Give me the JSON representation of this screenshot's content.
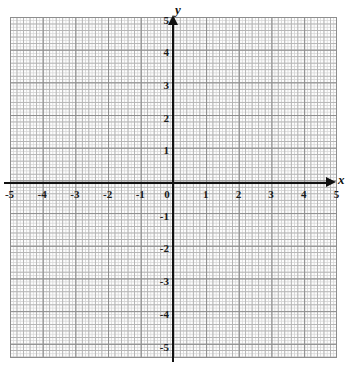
{
  "chart_data": {
    "type": "scatter",
    "title": "",
    "subtitle": "",
    "xlabel": "x",
    "ylabel": "y",
    "xlim": [
      -5,
      5
    ],
    "ylim": [
      -5,
      5
    ],
    "grid": true,
    "minor_grid": true,
    "legend": null,
    "series": [],
    "x": [],
    "y": [],
    "xticks": [
      -5,
      -4,
      -3,
      -2,
      -1,
      0,
      1,
      2,
      3,
      4,
      5
    ],
    "yticks": [
      -5,
      -4,
      -3,
      -2,
      -1,
      1,
      2,
      3,
      4,
      5
    ],
    "xtick_labels": [
      "-5",
      "-4",
      "-3",
      "-2",
      "-1",
      "0",
      "1",
      "2",
      "3",
      "4",
      "5"
    ],
    "ytick_labels": [
      "5",
      "4",
      "3",
      "2",
      "1",
      "-1",
      "-2",
      "-3",
      "-4",
      "-5"
    ],
    "annotations": []
  },
  "axes": {
    "x_name": "x",
    "y_name": "y",
    "origin_label": "0"
  },
  "x_ticks": [
    {
      "value": -5,
      "label": "-5"
    },
    {
      "value": -4,
      "label": "-4"
    },
    {
      "value": -3,
      "label": "-3"
    },
    {
      "value": -2,
      "label": "-2"
    },
    {
      "value": -1,
      "label": "-1"
    },
    {
      "value": 0,
      "label": "0"
    },
    {
      "value": 1,
      "label": "1"
    },
    {
      "value": 2,
      "label": "2"
    },
    {
      "value": 3,
      "label": "3"
    },
    {
      "value": 4,
      "label": "4"
    },
    {
      "value": 5,
      "label": "5"
    }
  ],
  "y_ticks": [
    {
      "value": 5,
      "label": "5"
    },
    {
      "value": 4,
      "label": "4"
    },
    {
      "value": 3,
      "label": "3"
    },
    {
      "value": 2,
      "label": "2"
    },
    {
      "value": 1,
      "label": "1"
    },
    {
      "value": -1,
      "label": "-1"
    },
    {
      "value": -2,
      "label": "-2"
    },
    {
      "value": -3,
      "label": "-3"
    },
    {
      "value": -4,
      "label": "-4"
    },
    {
      "value": -5,
      "label": "-5"
    }
  ],
  "colors": {
    "axis": "#111111",
    "major_grid": "#8d8d8d",
    "medium_grid": "#b4b4b4",
    "minor_grid": "#d8d8d8",
    "paper": "#fdfdfd",
    "label": "#1a1a1a"
  }
}
